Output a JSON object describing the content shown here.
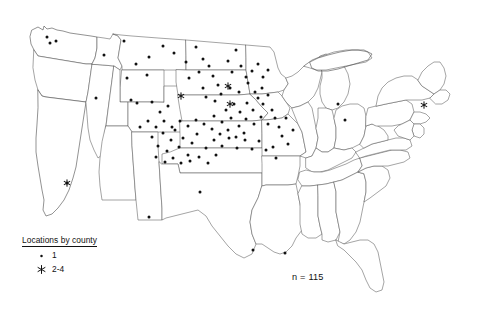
{
  "figure": {
    "title": "",
    "n_label": "n = 115",
    "background": "#ffffff",
    "outline_color": "#5a5a5a",
    "marker_color": "#111111"
  },
  "legend": {
    "title": "Locations by county",
    "items": [
      {
        "symbol": "dot",
        "label": "1"
      },
      {
        "symbol": "asterisk",
        "label": "2-4"
      }
    ]
  },
  "chart_data": {
    "type": "scatter",
    "title": "Locations by county",
    "xlabel": "",
    "ylabel": "",
    "annotations": [
      "n = 115"
    ],
    "legend_position": "bottom-left",
    "grid": false,
    "projection": "United States contiguous states outline",
    "series": [
      {
        "name": "1",
        "symbol": "dot",
        "count_per_marker": 1,
        "points": [
          [
            47,
            37
          ],
          [
            50,
            43
          ],
          [
            56,
            41
          ],
          [
            104,
            55
          ],
          [
            96,
            98
          ],
          [
            67,
            183
          ],
          [
            124,
            41
          ],
          [
            136,
            64
          ],
          [
            149,
            57
          ],
          [
            147,
            75
          ],
          [
            127,
            78
          ],
          [
            131,
            100
          ],
          [
            137,
            103
          ],
          [
            152,
            102
          ],
          [
            163,
            46
          ],
          [
            174,
            53
          ],
          [
            186,
            62
          ],
          [
            196,
            47
          ],
          [
            203,
            59
          ],
          [
            209,
            66
          ],
          [
            189,
            78
          ],
          [
            199,
            72
          ],
          [
            213,
            76
          ],
          [
            203,
            88
          ],
          [
            218,
            85
          ],
          [
            228,
            61
          ],
          [
            236,
            50
          ],
          [
            241,
            66
          ],
          [
            232,
            72
          ],
          [
            246,
            77
          ],
          [
            230,
            88
          ],
          [
            239,
            92
          ],
          [
            248,
            83
          ],
          [
            252,
            71
          ],
          [
            258,
            64
          ],
          [
            263,
            77
          ],
          [
            255,
            92
          ],
          [
            262,
            88
          ],
          [
            268,
            70
          ],
          [
            206,
            97
          ],
          [
            215,
            101
          ],
          [
            221,
            94
          ],
          [
            226,
            110
          ],
          [
            234,
            104
          ],
          [
            240,
            112
          ],
          [
            247,
            103
          ],
          [
            253,
            110
          ],
          [
            258,
            98
          ],
          [
            263,
            104
          ],
          [
            268,
            95
          ],
          [
            272,
            110
          ],
          [
            214,
            116
          ],
          [
            222,
            122
          ],
          [
            231,
            118
          ],
          [
            239,
            126
          ],
          [
            246,
            119
          ],
          [
            254,
            124
          ],
          [
            261,
            117
          ],
          [
            268,
            124
          ],
          [
            275,
            118
          ],
          [
            152,
            137
          ],
          [
            158,
            146
          ],
          [
            163,
            133
          ],
          [
            167,
            151
          ],
          [
            171,
            140
          ],
          [
            175,
            130
          ],
          [
            179,
            147
          ],
          [
            183,
            138
          ],
          [
            188,
            155
          ],
          [
            192,
            143
          ],
          [
            197,
            134
          ],
          [
            156,
            157
          ],
          [
            165,
            162
          ],
          [
            173,
            158
          ],
          [
            181,
            163
          ],
          [
            190,
            161
          ],
          [
            199,
            157
          ],
          [
            208,
            163
          ],
          [
            216,
            155
          ],
          [
            206,
            148
          ],
          [
            214,
            140
          ],
          [
            222,
            146
          ],
          [
            229,
            138
          ],
          [
            237,
            148
          ],
          [
            245,
            140
          ],
          [
            252,
            149
          ],
          [
            259,
            141
          ],
          [
            266,
            150
          ],
          [
            273,
            147
          ],
          [
            276,
            158
          ],
          [
            282,
            136
          ],
          [
            288,
            144
          ],
          [
            200,
            192
          ],
          [
            149,
            217
          ],
          [
            253,
            250
          ],
          [
            285,
            253
          ],
          [
            345,
            120
          ],
          [
            338,
            104
          ],
          [
            279,
            127
          ],
          [
            286,
            118
          ],
          [
            293,
            130
          ],
          [
            244,
            133
          ],
          [
            236,
            137
          ],
          [
            228,
            130
          ],
          [
            220,
            134
          ],
          [
            212,
            129
          ],
          [
            204,
            124
          ],
          [
            196,
            120
          ],
          [
            188,
            126
          ],
          [
            180,
            121
          ],
          [
            172,
            127
          ],
          [
            164,
            121
          ],
          [
            156,
            127
          ],
          [
            148,
            121
          ],
          [
            140,
            127
          ],
          [
            160,
            112
          ],
          [
            168,
            106
          ]
        ]
      },
      {
        "name": "2-4",
        "symbol": "asterisk",
        "count_per_marker": "2-4",
        "points": [
          [
            67,
            183
          ],
          [
            181,
            96
          ],
          [
            230,
            104
          ],
          [
            424,
            105
          ],
          [
            228,
            86
          ]
        ]
      }
    ]
  }
}
